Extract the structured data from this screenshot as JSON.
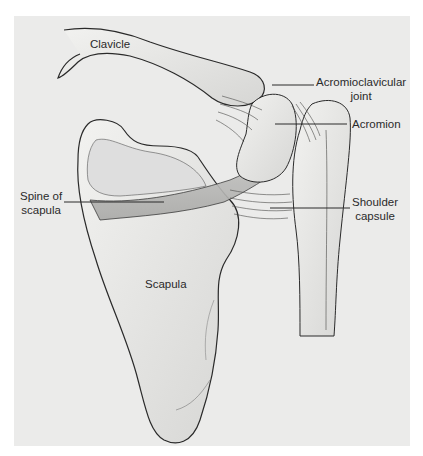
{
  "figure": {
    "background_color": "#ebebea",
    "line_color": "#2a2a2a",
    "labels": [
      {
        "id": "clavicle",
        "text": "Clavicle"
      },
      {
        "id": "acromioclavicular_joint",
        "line1": "Acromioclavicular",
        "line2": "joint"
      },
      {
        "id": "acromion",
        "text": "Acromion"
      },
      {
        "id": "spine_of_scapula",
        "line1": "Spine of",
        "line2": "scapula"
      },
      {
        "id": "shoulder_capsule",
        "line1": "Shoulder",
        "line2": "capsule"
      },
      {
        "id": "scapula",
        "text": "Scapula"
      }
    ]
  }
}
